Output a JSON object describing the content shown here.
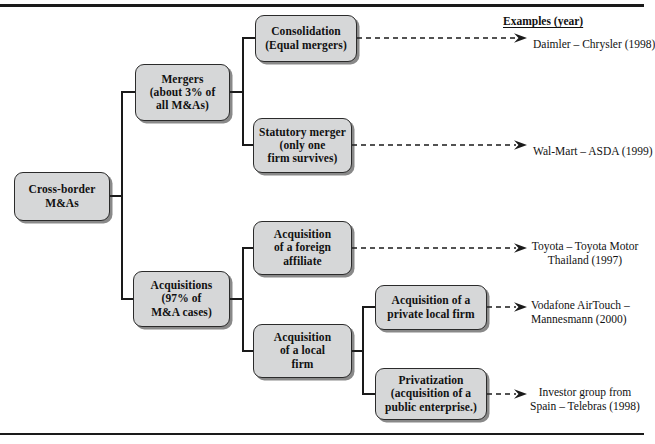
{
  "figure": {
    "title_column": "Examples (year)",
    "root": {
      "lines": [
        "Cross-border",
        "M&As"
      ]
    },
    "level2": [
      {
        "lines": [
          "Mergers",
          "(about 3% of",
          "all M&As)"
        ]
      },
      {
        "lines": [
          "Acquisitions",
          "(97% of",
          "M&A cases)"
        ]
      }
    ],
    "level3": [
      {
        "lines": [
          "Consolidation",
          "(Equal mergers)"
        ]
      },
      {
        "lines": [
          "Statutory merger",
          "(only one",
          "firm survives)"
        ]
      },
      {
        "lines": [
          "Acquisition",
          "of a foreign",
          "affiliate"
        ]
      },
      {
        "lines": [
          "Acquisition",
          "of a local",
          "firm"
        ]
      }
    ],
    "level4": [
      {
        "lines": [
          "Acquisition of a",
          "private local firm"
        ]
      },
      {
        "lines": [
          "Privatization",
          "(acquisition of a",
          "public enterprise.)"
        ]
      }
    ],
    "examples": [
      {
        "lines": [
          "Daimler – Chrysler (1998)"
        ]
      },
      {
        "lines": [
          "Wal-Mart – ASDA (1999)"
        ]
      },
      {
        "lines": [
          "Toyota – Toyota Motor",
          "Thailand (1997)"
        ]
      },
      {
        "lines": [
          "Vodafone AirTouch –",
          "Mannesmann (2000)"
        ]
      },
      {
        "lines": [
          "Investor group from",
          "Spain – Telebras (1998)"
        ]
      }
    ],
    "colors": {
      "box_fill": "#d6d7d8",
      "box_border": "#2b2b2b",
      "line": "#1a1a1a",
      "text": "#111111",
      "page_background": "#ffffff"
    }
  }
}
